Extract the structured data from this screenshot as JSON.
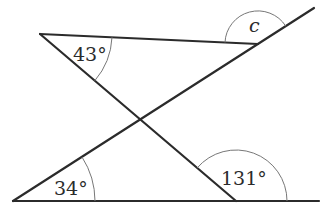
{
  "diagram": {
    "type": "geometry-angles",
    "lines": {
      "top_segment": {
        "from": [
          40,
          34
        ],
        "to": [
          258,
          44
        ]
      },
      "long_diagonal": {
        "from": [
          13,
          201
        ],
        "to": [
          314,
          8
        ]
      },
      "crossing_line": {
        "from": [
          40,
          34
        ],
        "to": [
          236,
          201
        ]
      },
      "bottom_line": {
        "from": [
          13,
          201
        ],
        "to": [
          319,
          201
        ]
      }
    },
    "angles": [
      {
        "id": "angle-top-left",
        "label": "43°",
        "vertex": [
          40,
          34
        ]
      },
      {
        "id": "angle-c",
        "label": "c",
        "vertex": [
          258,
          44
        ],
        "unknown": true
      },
      {
        "id": "angle-bottom-left",
        "label": "34°",
        "vertex": [
          13,
          201
        ]
      },
      {
        "id": "angle-bottom-right",
        "label": "131°",
        "vertex": [
          236,
          201
        ]
      }
    ]
  }
}
